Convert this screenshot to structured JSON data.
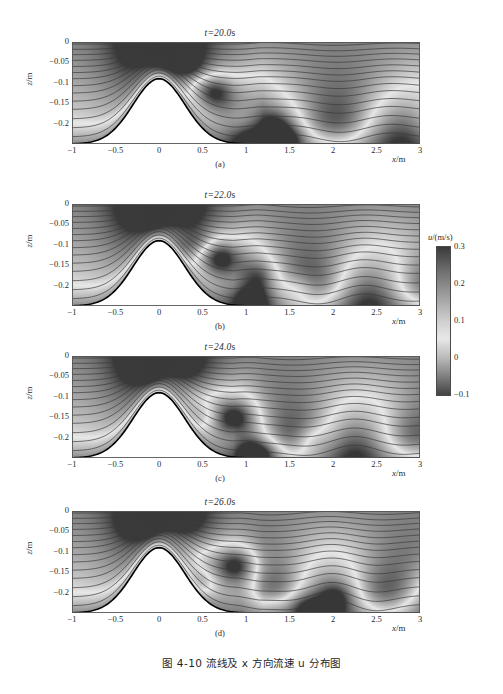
{
  "figure": {
    "caption": "图 4-10  流线及 x 方向流速 u 分布图",
    "background_color": "#ffffff",
    "line_color": "#3a3a3a",
    "bed_color": "#000000"
  },
  "colorbar": {
    "title_var": "u",
    "title_unit": "/(m/s)",
    "ticks": [
      "0.3",
      "0.2",
      "0.1",
      "0",
      "-0.1"
    ],
    "tick_values": [
      0.3,
      0.2,
      0.1,
      0,
      -0.1
    ],
    "vmin": -0.1,
    "vmax": 0.3,
    "colormap": "grayscale-diverging"
  },
  "axes": {
    "xlabel_var": "x",
    "xlabel_unit": "/m",
    "ylabel_var": "z",
    "ylabel_unit": "/m",
    "xticks": [
      "-1",
      "-0.5",
      "0",
      "0.5",
      "1",
      "1.5",
      "2",
      "2.5",
      "3"
    ],
    "xtick_values": [
      -1,
      -0.5,
      0,
      0.5,
      1,
      1.5,
      2,
      2.5,
      3
    ],
    "yticks": [
      "0",
      "-0.05",
      "-0.1",
      "-0.15",
      "-0.2"
    ],
    "ytick_values": [
      0,
      -0.05,
      -0.1,
      -0.15,
      -0.2
    ],
    "xlim": [
      -1,
      3
    ],
    "ylim": [
      -0.25,
      0
    ]
  },
  "panels": [
    {
      "title_var": "t",
      "title_value": "=20.0",
      "title_unit": "s",
      "sublabel": "(a)",
      "time": 20.0
    },
    {
      "title_var": "t",
      "title_value": "=22.0",
      "title_unit": "s",
      "sublabel": "(b)",
      "time": 22.0
    },
    {
      "title_var": "t",
      "title_value": "=24.0",
      "title_unit": "s",
      "sublabel": "(c)",
      "time": 24.0
    },
    {
      "title_var": "t",
      "title_value": "=26.0",
      "title_unit": "s",
      "sublabel": "(d)",
      "time": 26.0
    }
  ],
  "chart_data": {
    "type": "heatmap",
    "title": "图 4-10  流线及 x 方向流速 u 分布图",
    "xlabel": "x/m",
    "ylabel": "z/m",
    "colorbar_label": "u/(m/s)",
    "xlim": [
      -1,
      3
    ],
    "ylim": [
      -0.25,
      0
    ],
    "zlim": [
      -0.1,
      0.3
    ],
    "grid": false,
    "legend": "colorbar-right",
    "bed": {
      "form": "gaussian-bump",
      "baseline_z": -0.25,
      "crest_z": -0.09,
      "crest_x": 0.0,
      "half_width": 0.42,
      "x_start": -1.0,
      "x_end": 3.0
    },
    "streamlines": {
      "count": 14,
      "inlet_z": [
        -0.005,
        -0.018,
        -0.031,
        -0.045,
        -0.06,
        -0.075,
        -0.09,
        -0.107,
        -0.125,
        -0.145,
        -0.165,
        -0.188,
        -0.21,
        -0.232
      ]
    },
    "panels": [
      {
        "label": "(a)",
        "time_s": 20.0,
        "title": "t=20.0s",
        "wave_amplitude": 0.012,
        "wave_number": 4.2,
        "wave_phase": 0.0,
        "dark_patches": [
          {
            "x": 0.05,
            "z": -0.03,
            "u": 0.3
          },
          {
            "x": 0.3,
            "z": -0.06,
            "u": 0.3
          },
          {
            "x": 1.35,
            "z": -0.2,
            "u": -0.05
          },
          {
            "x": 1.5,
            "z": -0.235,
            "u": -0.08
          }
        ],
        "bright_patches": [
          {
            "x": 0.62,
            "z": -0.12,
            "u": 0.0
          },
          {
            "x": 1.0,
            "z": -0.24,
            "u": 0.02
          }
        ]
      },
      {
        "label": "(b)",
        "time_s": 22.0,
        "title": "t=22.0s",
        "wave_amplitude": 0.013,
        "wave_number": 4.6,
        "wave_phase": 0.9,
        "dark_patches": [
          {
            "x": -0.1,
            "z": -0.03,
            "u": 0.3
          },
          {
            "x": 0.42,
            "z": -0.1,
            "u": 0.28
          },
          {
            "x": 1.62,
            "z": -0.205,
            "u": -0.06
          },
          {
            "x": 1.15,
            "z": -0.175,
            "u": -0.03
          }
        ],
        "bright_patches": [
          {
            "x": 0.7,
            "z": -0.13,
            "u": 0.0
          },
          {
            "x": 1.0,
            "z": -0.235,
            "u": 0.02
          }
        ]
      },
      {
        "label": "(c)",
        "time_s": 24.0,
        "title": "t=24.0s",
        "wave_amplitude": 0.014,
        "wave_number": 4.4,
        "wave_phase": 1.9,
        "dark_patches": [
          {
            "x": -0.15,
            "z": -0.035,
            "u": 0.3
          },
          {
            "x": 0.55,
            "z": -0.145,
            "u": 0.26
          },
          {
            "x": 1.75,
            "z": -0.205,
            "u": -0.05
          },
          {
            "x": 1.25,
            "z": -0.235,
            "u": -0.07
          }
        ],
        "bright_patches": [
          {
            "x": 0.85,
            "z": -0.15,
            "u": 0.0
          },
          {
            "x": 1.05,
            "z": -0.24,
            "u": 0.02
          }
        ]
      },
      {
        "label": "(d)",
        "time_s": 26.0,
        "title": "t=26.0s",
        "wave_amplitude": 0.015,
        "wave_number": 4.8,
        "wave_phase": 2.8,
        "dark_patches": [
          {
            "x": -0.2,
            "z": -0.035,
            "u": 0.3
          },
          {
            "x": 0.5,
            "z": -0.175,
            "u": 0.27
          },
          {
            "x": 2.05,
            "z": -0.21,
            "u": -0.06
          },
          {
            "x": 1.3,
            "z": -0.24,
            "u": -0.05
          }
        ],
        "bright_patches": [
          {
            "x": 0.9,
            "z": -0.13,
            "u": 0.0
          },
          {
            "x": 1.65,
            "z": -0.235,
            "u": 0.02
          }
        ]
      }
    ]
  }
}
